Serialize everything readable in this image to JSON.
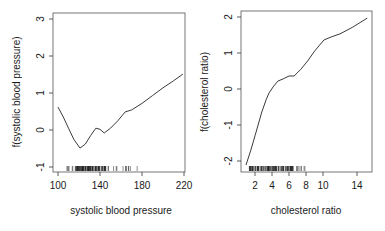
{
  "chart_data": [
    {
      "type": "line",
      "title": "",
      "xlabel": "systolic blood pressure",
      "ylabel": "f(systolic blood pressure)",
      "xlim": [
        97,
        222
      ],
      "ylim": [
        -1.15,
        3.15
      ],
      "xticks": [
        100,
        140,
        180,
        220
      ],
      "yticks": [
        -1,
        0,
        1,
        2,
        3
      ],
      "grid": false,
      "legend": null,
      "series": [
        {
          "name": "f(systolic blood pressure)",
          "x": [
            100,
            105,
            110,
            115,
            121,
            126,
            131,
            136,
            140,
            144,
            150,
            157,
            164,
            170,
            180,
            190,
            200,
            210,
            219
          ],
          "y": [
            0.62,
            0.35,
            0.05,
            -0.25,
            -0.49,
            -0.38,
            -0.15,
            0.05,
            0.02,
            -0.08,
            0.05,
            0.25,
            0.49,
            0.54,
            0.72,
            0.93,
            1.14,
            1.33,
            1.51
          ]
        }
      ],
      "rug": {
        "range": [
          108,
          176
        ],
        "dense_range": [
          116,
          146
        ]
      }
    },
    {
      "type": "line",
      "title": "",
      "xlabel": "cholesterol ratio",
      "ylabel": "f(cholesterol ratio)",
      "xlim": [
        0.3,
        16
      ],
      "ylim": [
        -2.3,
        2.15
      ],
      "xticks": [
        2,
        4,
        6,
        8,
        10,
        14
      ],
      "yticks": [
        -2,
        -1,
        0,
        1,
        2
      ],
      "grid": false,
      "legend": null,
      "series": [
        {
          "name": "f(cholesterol ratio)",
          "x": [
            0.94,
            1.5,
            2.0,
            2.8,
            3.3,
            3.65,
            4.2,
            4.7,
            5.3,
            6.0,
            6.6,
            7.4,
            8.2,
            9.0,
            10.1,
            11.0,
            12.0,
            13.5,
            15.2
          ],
          "y": [
            -2.11,
            -1.7,
            -1.3,
            -0.64,
            -0.3,
            -0.11,
            0.08,
            0.22,
            0.28,
            0.36,
            0.36,
            0.55,
            0.78,
            1.05,
            1.36,
            1.45,
            1.53,
            1.72,
            1.97
          ]
        }
      ],
      "rug": {
        "range": [
          1.3,
          8.8
        ],
        "dense_range": [
          1.3,
          6.5
        ]
      }
    }
  ],
  "panels": [
    {
      "xlabel": "systolic blood pressure",
      "ylabel": "f(systolic blood pressure)",
      "xtick_labels": [
        "100",
        "140",
        "180",
        "220"
      ],
      "ytick_labels": [
        "-1",
        "0",
        "1",
        "2",
        "3"
      ]
    },
    {
      "xlabel": "cholesterol ratio",
      "ylabel": "f(cholesterol ratio)",
      "xtick_labels": [
        "2",
        "4",
        "6",
        "8",
        "10",
        "14"
      ],
      "ytick_labels": [
        "-2",
        "-1",
        "0",
        "1",
        "2"
      ]
    }
  ],
  "colors": {
    "line": "#3a3a3a",
    "axis": "#333333",
    "rug": "#222222",
    "background": "#ffffff"
  }
}
